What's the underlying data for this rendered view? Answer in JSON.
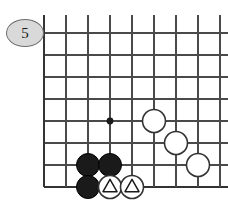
{
  "diagram": {
    "kind": "go-board-diagram",
    "move_number_label": "5",
    "board": {
      "cell_size": 22,
      "origin_x": 44,
      "origin_y": 33,
      "cols": 9,
      "rows": 8,
      "edges": {
        "left": true,
        "bottom": true,
        "top": false,
        "right": false
      },
      "col_x": [
        44,
        66,
        88,
        110,
        132,
        154,
        176,
        198,
        220
      ],
      "row_y": [
        33,
        55,
        77,
        99,
        121,
        143,
        165,
        187
      ],
      "line_color": "#4a4a4a",
      "edge_color": "#333333",
      "line_width": 1.6,
      "edge_width": 2.6,
      "overhang_top": 18
    },
    "star_points": [
      {
        "col": 3,
        "row": 4,
        "radius": 3.4
      }
    ],
    "stones": [
      {
        "color": "black",
        "col": 2,
        "row": 6,
        "mark": "none"
      },
      {
        "color": "black",
        "col": 3,
        "row": 6,
        "mark": "none"
      },
      {
        "color": "black",
        "col": 2,
        "row": 7,
        "mark": "none"
      },
      {
        "color": "white",
        "col": 3,
        "row": 7,
        "mark": "triangle"
      },
      {
        "color": "white",
        "col": 4,
        "row": 7,
        "mark": "triangle"
      },
      {
        "color": "white",
        "col": 5,
        "row": 4,
        "mark": "none"
      },
      {
        "color": "white",
        "col": 6,
        "row": 5,
        "mark": "none"
      },
      {
        "color": "white",
        "col": 7,
        "row": 6,
        "mark": "none"
      }
    ],
    "stone_radius": 11.5,
    "colors": {
      "black_stone_fill": "#1a1a1a",
      "black_stone_stroke": "#000000",
      "white_stone_fill": "#ffffff",
      "white_stone_stroke": "#333333",
      "mark_stroke": "#1a1a1a",
      "star_point_fill": "#1a1a1a",
      "label_background": "#d9d9d9",
      "label_border": "#6e6e6e",
      "label_text": "#1a1a1a",
      "background": "#ffffff"
    }
  }
}
